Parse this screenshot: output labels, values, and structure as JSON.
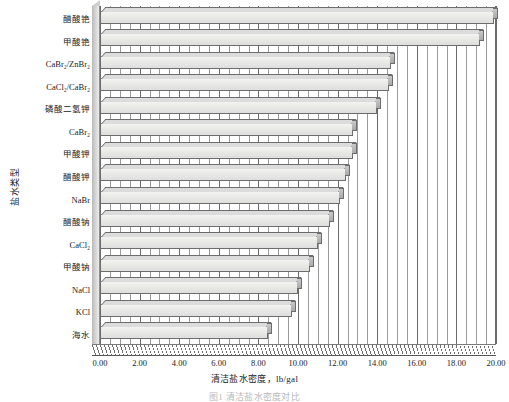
{
  "chart_data": {
    "type": "bar",
    "orientation": "horizontal",
    "title": "",
    "xlabel": "清洁盐水密度，lb/gal",
    "ylabel": "盐水类型",
    "xlim": [
      0.0,
      20.0
    ],
    "xticks": [
      "0.00",
      "2.00",
      "4.00",
      "6.00",
      "8.00",
      "10.00",
      "12.00",
      "14.00",
      "16.00",
      "18.00",
      "20.00"
    ],
    "xtick_step": 2.0,
    "minor_gridline_step": 0.5,
    "grid": true,
    "legend": "none",
    "style": "3d-bar",
    "categories": [
      "醋酸铯",
      "甲酸铯",
      "CaBr₂/ZnBr₂",
      "CaCl₂/CaBr₂",
      "磷酸二氢钾",
      "CaBr₂",
      "甲酸钾",
      "醋酸钾",
      "NaBr",
      "醋酸钠",
      "CaCl₂",
      "甲酸钠",
      "NaCl",
      "KCl",
      "海水"
    ],
    "values": [
      19.9,
      19.2,
      14.7,
      14.6,
      14.0,
      12.8,
      12.8,
      12.4,
      12.1,
      11.6,
      11.0,
      10.6,
      10.0,
      9.7,
      8.5
    ]
  },
  "axis": {
    "y_title": "盐水类型",
    "x_title": "清洁盐水密度，lb/gal"
  },
  "caption": "图1  清洁盐水密度对比",
  "colors": {
    "bar_face": "#e9e9e6",
    "bar_edge": "#6d6d6d",
    "grid": "#7d7d7d",
    "text": "#1b1b1b"
  }
}
